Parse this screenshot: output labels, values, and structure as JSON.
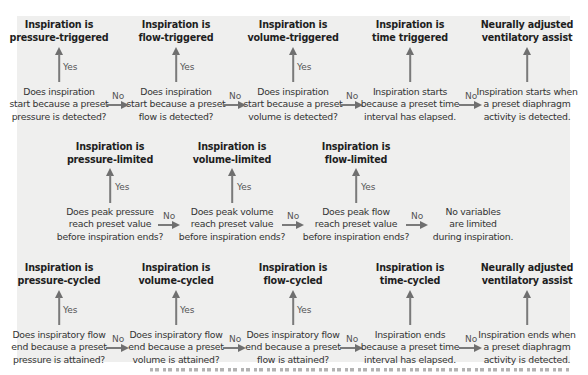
{
  "colors": {
    "background": "#efefee",
    "text": "#2b2b2b",
    "arrow": "#777777"
  },
  "labels": {
    "yes": "Yes",
    "no": "No"
  },
  "rows": [
    {
      "name": "trigger",
      "nodes": [
        {
          "outcome": [
            "Inspiration is",
            "pressure-triggered"
          ],
          "question": [
            "Does inspiration",
            "start because a preset",
            "pressure is detected?"
          ],
          "has_yes": true
        },
        {
          "outcome": [
            "Inspiration is",
            "flow-triggered"
          ],
          "question": [
            "Does inspiration",
            "start because a preset",
            "flow is detected?"
          ],
          "has_yes": true
        },
        {
          "outcome": [
            "Inspiration is",
            "volume-triggered"
          ],
          "question": [
            "Does inspiration",
            "start because a preset",
            "volume is detected?"
          ],
          "has_yes": true
        },
        {
          "outcome": [
            "Inspiration is",
            "time triggered"
          ],
          "question": [
            "Inspiration starts",
            "because a preset time",
            "interval has elapsed."
          ],
          "has_yes": false
        },
        {
          "outcome": [
            "Neurally adjusted",
            "ventilatory assist"
          ],
          "question": [
            "Inspiration starts when",
            "a preset diaphragm",
            "activity is detected."
          ],
          "has_yes": false
        }
      ]
    },
    {
      "name": "limit",
      "nodes": [
        {
          "outcome": [
            "Inspiration is",
            "pressure-limited"
          ],
          "question": [
            "Does peak pressure",
            "reach preset value",
            "before inspiration ends?"
          ],
          "has_yes": true
        },
        {
          "outcome": [
            "Inspiration is",
            "volume-limited"
          ],
          "question": [
            "Does peak volume",
            "reach preset value",
            "before inspiration ends?"
          ],
          "has_yes": true
        },
        {
          "outcome": [
            "Inspiration is",
            "flow-limited"
          ],
          "question": [
            "Does peak flow",
            "reach preset value",
            "before inspiration ends?"
          ],
          "has_yes": true
        },
        {
          "outcome": null,
          "question": [
            "No variables",
            "are limited",
            "during inspiration."
          ],
          "has_yes": false
        }
      ]
    },
    {
      "name": "cycle",
      "nodes": [
        {
          "outcome": [
            "Inspiration is",
            "pressure-cycled"
          ],
          "question": [
            "Does inspiratory flow",
            "end because a preset",
            "pressure is attained?"
          ],
          "has_yes": true
        },
        {
          "outcome": [
            "Inspiration is",
            "volume-cycled"
          ],
          "question": [
            "Does inspiratory flow",
            "end because a preset",
            "volume is attained?"
          ],
          "has_yes": true
        },
        {
          "outcome": [
            "Inspiration is",
            "flow-cycled"
          ],
          "question": [
            "Does inspiratory flow",
            "end because a preset",
            "flow is attained?"
          ],
          "has_yes": true
        },
        {
          "outcome": [
            "Inspiration is",
            "time-cycled"
          ],
          "question": [
            "Inspiration ends",
            "because a preset time",
            "interval has elapsed."
          ],
          "has_yes": false
        },
        {
          "outcome": [
            "Neurally adjusted",
            "ventilatory assist"
          ],
          "question": [
            "Inspiration ends when",
            "a preset diaphragm",
            "activity is detected."
          ],
          "has_yes": false
        }
      ]
    }
  ]
}
